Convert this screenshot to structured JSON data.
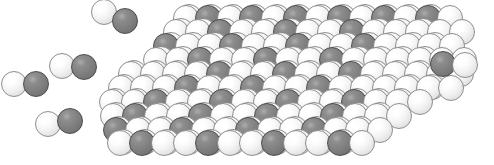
{
  "figure": {
    "type": "space-filling-molecular-model",
    "background_color": "#ffffff",
    "width": 494,
    "height": 165
  },
  "species": [
    {
      "key": "light",
      "label": "light atom",
      "color": "#f2f2f2",
      "outline": "#8e8e8e"
    },
    {
      "key": "dark",
      "label": "dark atom",
      "color": "#808080",
      "outline": "#4b4b4b"
    }
  ],
  "slab": {
    "label": "crystal slab",
    "description": "Close-packed binary slab viewed in perspective, alternating light and dark atoms.",
    "atom_radius": 13,
    "row_dx": 22.0,
    "row_dy": 14.0,
    "row_shear": 9.0,
    "layer_offset_x": -7.0,
    "layer_offset_y": 5.0,
    "rows": [
      {
        "y": 18,
        "x": 186,
        "n": 13,
        "pattern": "ldldldldldldl"
      },
      {
        "y": 32,
        "x": 176,
        "n": 14,
        "pattern": "lldlldlldllll"
      },
      {
        "y": 46,
        "x": 166,
        "n": 14,
        "pattern": "dlldlldlldlll"
      },
      {
        "y": 60,
        "x": 156,
        "n": 15,
        "pattern": "lldlldlldllll"
      },
      {
        "y": 74,
        "x": 131,
        "n": 16,
        "pattern": "lllldlldlldlllll"
      },
      {
        "y": 88,
        "x": 121,
        "n": 16,
        "pattern": "llldlldlldllllll"
      },
      {
        "y": 102,
        "x": 112,
        "n": 15,
        "pattern": "lldlldlldlldlll"
      },
      {
        "y": 116,
        "x": 113,
        "n": 14,
        "pattern": "ldlldlldlldlll"
      },
      {
        "y": 130,
        "x": 116,
        "n": 13,
        "pattern": "dlldlldlldlll"
      },
      {
        "y": 143,
        "x": 120,
        "n": 12,
        "pattern": "ldlldlldlldl"
      }
    ],
    "back_rows": [
      {
        "y": 12,
        "x": 196,
        "n": 12,
        "pattern": "llllllllllll"
      },
      {
        "y": 26,
        "x": 188,
        "n": 12,
        "pattern": "llllllllllll"
      },
      {
        "y": 40,
        "x": 178,
        "n": 13,
        "pattern": "lllllllllllll"
      },
      {
        "y": 54,
        "x": 168,
        "n": 13,
        "pattern": "lllllllllllll"
      },
      {
        "y": 68,
        "x": 141,
        "n": 15,
        "pattern": "lllllllllllllll"
      },
      {
        "y": 82,
        "x": 131,
        "n": 15,
        "pattern": "lllllllllllllll"
      },
      {
        "y": 96,
        "x": 122,
        "n": 14,
        "pattern": "llllllllllllll"
      },
      {
        "y": 110,
        "x": 123,
        "n": 13,
        "pattern": "lllllllllllll"
      },
      {
        "y": 124,
        "x": 126,
        "n": 12,
        "pattern": "llllllllllll"
      },
      {
        "y": 137,
        "x": 130,
        "n": 11,
        "pattern": "lllllllllll"
      }
    ]
  },
  "molecules": [
    {
      "name": "molecule-top-left",
      "x": 104,
      "y": 12,
      "first": "light",
      "second": "dark",
      "dx": 21,
      "dy": 9,
      "r": 13
    },
    {
      "name": "molecule-mid-left",
      "x": 14,
      "y": 84,
      "first": "light",
      "second": "dark",
      "dx": 22,
      "dy": 0,
      "r": 13
    },
    {
      "name": "molecule-upper-left-2",
      "x": 62,
      "y": 66,
      "first": "light",
      "second": "dark",
      "dx": 22,
      "dy": 1,
      "r": 13
    },
    {
      "name": "molecule-bottom-left",
      "x": 48,
      "y": 124,
      "first": "light",
      "second": "dark",
      "dx": 22,
      "dy": -3,
      "r": 13
    },
    {
      "name": "molecule-right",
      "x": 443,
      "y": 64,
      "first": "dark",
      "second": "light",
      "dx": 22,
      "dy": 1,
      "r": 13
    }
  ]
}
